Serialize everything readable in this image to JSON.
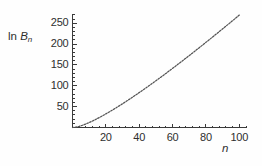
{
  "chart_data": {
    "type": "line",
    "title": "",
    "subtitle": "",
    "xlabel": "n",
    "ylabel": "ln B_n",
    "ylabel_parts": {
      "prefix": "ln ",
      "symbol": "B",
      "subscript": "n"
    },
    "xlim": [
      0,
      104
    ],
    "ylim": [
      0,
      272
    ],
    "grid": false,
    "legend": null,
    "line_style": "dotted",
    "line_color": "#545454",
    "axis_color": "#3a3a3a",
    "background_color": "#fefefe",
    "xticks": [
      20,
      40,
      60,
      80,
      100
    ],
    "xticklabels": [
      "20",
      "40",
      "60",
      "80",
      "100"
    ],
    "x_minor_step": 4,
    "yticks": [
      50,
      100,
      150,
      200,
      250
    ],
    "yticklabels": [
      "50",
      "100",
      "150",
      "200",
      "250"
    ],
    "y_minor_step": 10,
    "series": [
      {
        "name": "ln B_n",
        "x": [
          0,
          2,
          4,
          6,
          8,
          10,
          12,
          14,
          16,
          18,
          20,
          22,
          24,
          26,
          28,
          30,
          32,
          34,
          36,
          38,
          40,
          42,
          44,
          46,
          48,
          50,
          52,
          54,
          56,
          58,
          60,
          62,
          64,
          66,
          68,
          70,
          72,
          74,
          76,
          78,
          80,
          82,
          84,
          86,
          88,
          90,
          92,
          94,
          96,
          98,
          100
        ],
        "y": [
          0,
          0.69,
          2.71,
          5.35,
          8.45,
          11.89,
          15.61,
          19.57,
          23.73,
          28.07,
          32.57,
          37.21,
          41.98,
          46.86,
          51.85,
          56.94,
          62.12,
          67.38,
          72.73,
          78.14,
          83.63,
          89.19,
          94.81,
          100.49,
          106.23,
          112.02,
          117.87,
          123.76,
          129.7,
          135.68,
          141.71,
          147.78,
          153.89,
          160.04,
          166.23,
          172.45,
          178.71,
          185.0,
          191.32,
          197.68,
          204.06,
          210.48,
          216.92,
          223.39,
          229.89,
          236.42,
          242.97,
          249.55,
          256.15,
          262.78,
          269.43
        ]
      }
    ]
  }
}
